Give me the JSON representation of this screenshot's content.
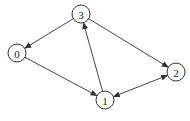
{
  "diagram": {
    "type": "directed-graph",
    "nodes": [
      {
        "id": "0",
        "label": "0",
        "x": 17,
        "y": 53
      },
      {
        "id": "1",
        "label": "1",
        "x": 105,
        "y": 100
      },
      {
        "id": "2",
        "label": "2",
        "x": 176,
        "y": 72
      },
      {
        "id": "3",
        "label": "3",
        "x": 81,
        "y": 14
      }
    ],
    "edges": [
      {
        "from": "3",
        "to": "0",
        "bidirectional": false
      },
      {
        "from": "3",
        "to": "2",
        "bidirectional": false
      },
      {
        "from": "0",
        "to": "1",
        "bidirectional": false
      },
      {
        "from": "1",
        "to": "3",
        "bidirectional": false
      },
      {
        "from": "1",
        "to": "2",
        "bidirectional": true
      }
    ],
    "colors": {
      "stroke": "#444444",
      "node_fill": "#ffffff"
    }
  }
}
